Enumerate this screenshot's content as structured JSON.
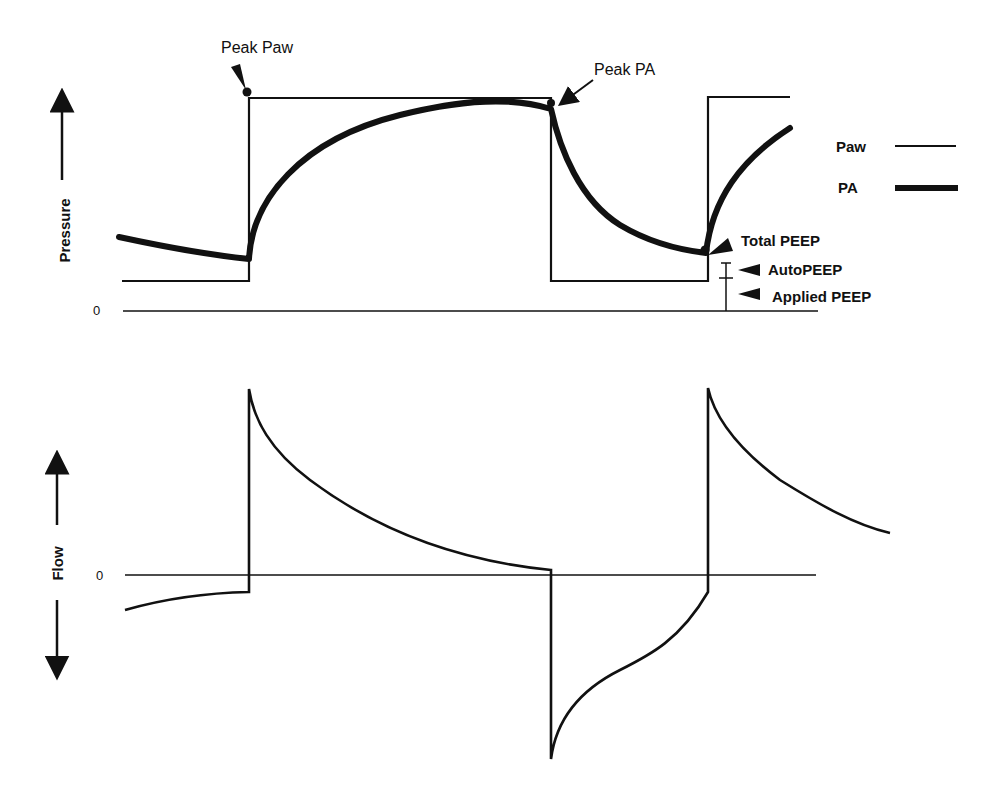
{
  "pressure_panel": {
    "axis_label": "Pressure",
    "zero_label": "0",
    "annotations": {
      "peak_paw": "Peak Paw",
      "peak_pa": "Peak PA",
      "total_peep": "Total PEEP",
      "auto_peep": "AutoPEEP",
      "applied_peep": "Applied PEEP"
    },
    "legend": [
      {
        "label": "Paw",
        "style": "thin line"
      },
      {
        "label": "PA",
        "style": "thick line"
      }
    ]
  },
  "flow_panel": {
    "axis_label": "Flow",
    "zero_label": "0"
  },
  "colors": {
    "line": "#111111",
    "background": "#ffffff"
  }
}
